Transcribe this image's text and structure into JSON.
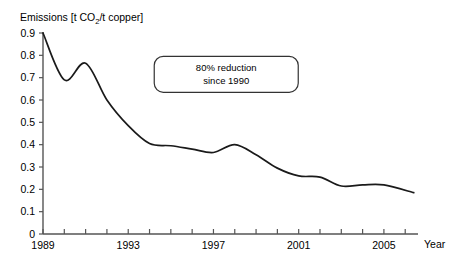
{
  "chart_data": {
    "type": "line",
    "title": "",
    "ylabel_parts": {
      "prefix": "Emissions [t CO",
      "subscript": "2",
      "suffix": "/t copper]"
    },
    "ylabel": "Emissions [t CO2/t copper]",
    "xlabel": "Year",
    "xlim": [
      1989,
      2006.6
    ],
    "ylim": [
      0,
      0.9
    ],
    "grid": false,
    "legend": false,
    "y_ticks": [
      0,
      0.1,
      0.2,
      0.3,
      0.4,
      0.5,
      0.6,
      0.7,
      0.8,
      0.9
    ],
    "y_tick_labels": [
      "0",
      "0.1",
      "0.2",
      "0.3",
      "0.4",
      "0.5",
      "0.6",
      "0.7",
      "0.8",
      "0.9"
    ],
    "x_ticks": [
      1989,
      1990,
      1991,
      1992,
      1993,
      1994,
      1995,
      1996,
      1997,
      1998,
      1999,
      2000,
      2001,
      2002,
      2003,
      2004,
      2005,
      2006
    ],
    "x_tick_labels": [
      "1989",
      "",
      "",
      "",
      "1993",
      "",
      "",
      "",
      "1997",
      "",
      "",
      "",
      "2001",
      "",
      "",
      "",
      "2005",
      ""
    ],
    "x_labeled_ticks": [
      {
        "value": 1989,
        "label": "1989"
      },
      {
        "value": 1993,
        "label": "1993"
      },
      {
        "value": 1997,
        "label": "1997"
      },
      {
        "value": 2001,
        "label": "2001"
      },
      {
        "value": 2005,
        "label": "2005"
      }
    ],
    "series": [
      {
        "name": "Emissions per tonne copper",
        "color": "#1a1a1a",
        "x": [
          1989,
          1990,
          1991,
          1992,
          1993,
          1994,
          1995,
          1996,
          1997,
          1998,
          1999,
          2000,
          2001,
          2002,
          2003,
          2004,
          2005,
          2006.4
        ],
        "values": [
          0.9,
          0.69,
          0.765,
          0.6,
          0.485,
          0.405,
          0.395,
          0.38,
          0.365,
          0.4,
          0.355,
          0.295,
          0.26,
          0.255,
          0.215,
          0.22,
          0.22,
          0.185
        ]
      }
    ],
    "annotations": [
      {
        "type": "boxed-text",
        "lines": [
          "80% reduction",
          "since 1990"
        ],
        "x_data": 1997.6,
        "y_data": 0.715
      }
    ],
    "colors": {
      "line": "#1a1a1a",
      "axis": "#555555",
      "text": "#000000",
      "background": "#ffffff",
      "annotation_border": "#333333"
    }
  }
}
